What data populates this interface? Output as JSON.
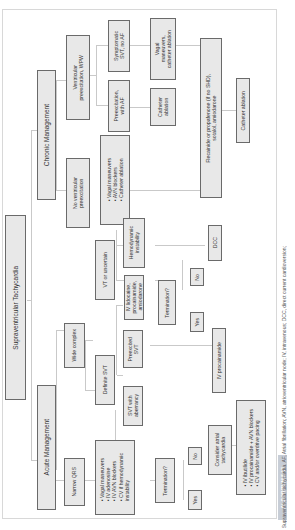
{
  "diagram": {
    "title": "Supraventricular Tachycardia",
    "branches": {
      "acute": "Acute Management",
      "chronic": "Chronic Management"
    },
    "acute": {
      "narrow_qrs": "Narrow QRS",
      "narrow_treatment": "• Vagal maneuvers\n• IV adenosine\n• IV AVN blockers\n• CV if hemodynamic\n  instability",
      "narrow_termination": "Termination?",
      "narrow_yes": "Yes",
      "narrow_no": "No",
      "consider_atrial": "Consider atrial\ntachycardia",
      "atrial_treatment": "• IV ibutilide\n• IV procainamide + AVN blockers\n• CV and/or overdrive pacing",
      "wide_complex": "Wide complex",
      "definite_svt": "Definite SVT",
      "svt_aberrancy": "SVT with\naberrancy",
      "preexcited_svt": "Preexcited\nSVT",
      "iv_procainamide": "IV procainamide",
      "vt_uncertain": "VT or uncertain",
      "iv_lidocaine": "IV lidocaine,\nprocainamide,\namiodarone",
      "hemodynamic": "Hemodynamic\ninstability",
      "wide_termination": "Termination?",
      "wide_yes": "Yes",
      "wide_no": "No",
      "dcc": "DCC"
    },
    "chronic": {
      "no_preexcitation": "No ventricular\npreexcitation",
      "no_pre_treatment": "• Vagal maneuvers\n• AVN blockers\n• Catheter ablation",
      "preexcitation_wpw": "Ventricular\npreexcitation, WPW",
      "preexcitation_af": "Preexcitation,\nwith AF",
      "symptomatic_svt": "Symptomatic\nSVT, no AF",
      "catheter_ablation_1": "Catheter\nablation",
      "vagal_catheter": "Vagal\nmaneuvers,\ncatheter ablation",
      "flecainide": "Flecainide or propafenone (if no SHD),\nsotalol, amiodarone",
      "catheter_ablation_2": "Catheter ablation"
    }
  },
  "figure_label": "ALGORITHM 5.15",
  "caption": "Supraventricular tachycardia. AF, Atrial fibrillation; AVN, atrioventricular node; IV, intravenous; DCC, direct current cardioversion;"
}
